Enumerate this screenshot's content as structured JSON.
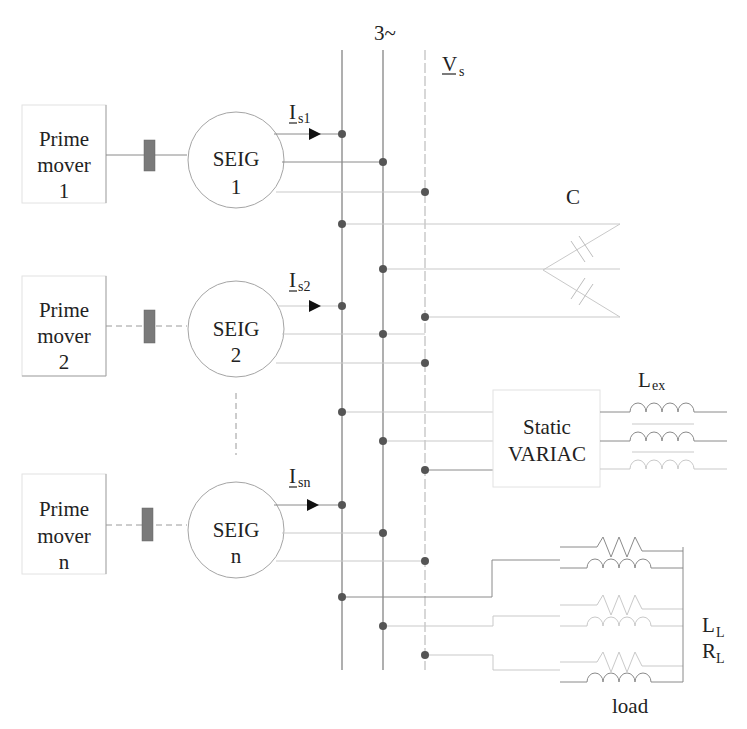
{
  "diagram": {
    "bus_label": "3~",
    "voltage_label": {
      "main": "V",
      "sub": "s"
    },
    "generators": [
      {
        "prime_mover": [
          "Prime",
          "mover",
          "1"
        ],
        "seig": [
          "SEIG",
          "1"
        ],
        "current": {
          "main": "I",
          "sub": "s1"
        }
      },
      {
        "prime_mover": [
          "Prime",
          "mover",
          "2"
        ],
        "seig": [
          "SEIG",
          "2"
        ],
        "current": {
          "main": "I",
          "sub": "s2"
        }
      },
      {
        "prime_mover": [
          "Prime",
          "mover",
          "n"
        ],
        "seig": [
          "SEIG",
          "n"
        ],
        "current": {
          "main": "I",
          "sub": "sn"
        }
      }
    ],
    "capacitor_label": "C",
    "variac": {
      "line1": "Static",
      "line2": "VARIAC"
    },
    "excitation_inductor": {
      "main": "L",
      "sub": "ex"
    },
    "load": {
      "inductor": {
        "main": "L",
        "sub": "L"
      },
      "resistor": {
        "main": "R",
        "sub": "L"
      },
      "label": "load"
    },
    "colors": {
      "wire": "#8a8a8a",
      "dot": "#555555",
      "coupling": "#7a7a7a",
      "text": "#222222"
    }
  }
}
